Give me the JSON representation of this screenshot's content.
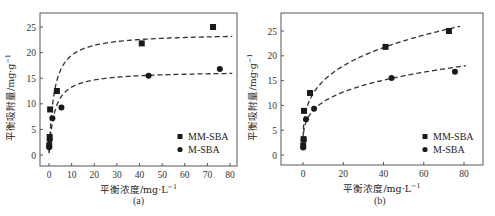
{
  "chart_data": [
    {
      "panel": "(a)",
      "type": "scatter",
      "title": "",
      "xlabel": "平衡浓度/mg·L⁻¹",
      "ylabel": "平衡吸附量/mg·g⁻¹",
      "xlim": [
        -5,
        85
      ],
      "ylim": [
        -2,
        27.5
      ],
      "xticks": [
        0,
        10,
        20,
        30,
        40,
        50,
        60,
        70,
        80
      ],
      "yticks": [
        0,
        5,
        10,
        15,
        20,
        25
      ],
      "grid": false,
      "legend_position": "lower right",
      "series": [
        {
          "name": "MM-SBA",
          "marker": "square",
          "x": [
            0.1,
            0.3,
            0.5,
            3.5,
            41,
            72.5
          ],
          "y": [
            1.9,
            3.5,
            8.9,
            12.5,
            21.8,
            25.0
          ],
          "fit": "Langmuir (dashed)",
          "fit_curve": {
            "qmax": 23.8,
            "K": 0.45
          }
        },
        {
          "name": "M-SBA",
          "marker": "circle",
          "x": [
            0.1,
            0.3,
            1.5,
            5.5,
            44,
            75.5
          ],
          "y": [
            1.5,
            3.0,
            7.2,
            9.3,
            15.5,
            16.8
          ],
          "fit": "Langmuir (dashed)",
          "fit_curve": {
            "qmax": 16.4,
            "K": 0.42
          }
        }
      ]
    },
    {
      "panel": "(b)",
      "type": "scatter",
      "title": "",
      "xlabel": "平衡浓度/mg·L⁻¹",
      "ylabel": "平衡吸附量/mg·g⁻¹",
      "xlim": [
        -10,
        90
      ],
      "ylim": [
        -2,
        28.5
      ],
      "xticks": [
        0,
        20,
        40,
        60,
        80
      ],
      "yticks": [
        0,
        5,
        10,
        15,
        20,
        25
      ],
      "grid": false,
      "legend_position": "lower right",
      "series": [
        {
          "name": "MM-SBA",
          "marker": "square",
          "x": [
            0.1,
            0.3,
            0.5,
            3.5,
            41,
            72.5
          ],
          "y": [
            1.9,
            3.2,
            8.9,
            12.5,
            21.8,
            25.0
          ],
          "fit": "Freundlich (dashed)",
          "fit_curve": {
            "Kf": 8.0,
            "n_inv": 0.27
          }
        },
        {
          "name": "M-SBA",
          "marker": "circle",
          "x": [
            0.1,
            0.3,
            1.5,
            5.5,
            44,
            75.5
          ],
          "y": [
            1.5,
            3.0,
            7.2,
            9.3,
            15.5,
            16.8
          ],
          "fit": "Freundlich (dashed)",
          "fit_curve": {
            "Kf": 6.0,
            "n_inv": 0.25
          }
        }
      ]
    }
  ],
  "labels": {
    "panel_a": "(a)",
    "panel_b": "(b)",
    "xlabel": "平衡浓度/mg·L",
    "xlabel_sup": "−1",
    "ylabel": "平衡吸附量/mg·g",
    "ylabel_sup": "−1",
    "legend": [
      "MM-SBA",
      "M-SBA"
    ]
  }
}
